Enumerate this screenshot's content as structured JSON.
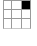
{
  "widget": {
    "type": "grid-selector",
    "name": "3x3 grid",
    "rows": 3,
    "columns": 3,
    "line_color": "#9a9a9a",
    "bottom_line_color": "#c8c8c8",
    "fill_color": "#000000",
    "background_color": "#ffffff",
    "cells": [
      {
        "row": 0,
        "col": 0,
        "state": "empty",
        "label": ""
      },
      {
        "row": 0,
        "col": 1,
        "state": "empty",
        "label": ""
      },
      {
        "row": 0,
        "col": 2,
        "state": "filled",
        "label": ""
      },
      {
        "row": 1,
        "col": 0,
        "state": "empty",
        "label": ""
      },
      {
        "row": 1,
        "col": 1,
        "state": "empty",
        "label": ""
      },
      {
        "row": 1,
        "col": 2,
        "state": "empty",
        "label": ""
      },
      {
        "row": 2,
        "col": 0,
        "state": "empty",
        "label": ""
      },
      {
        "row": 2,
        "col": 1,
        "state": "empty",
        "label": ""
      },
      {
        "row": 2,
        "col": 2,
        "state": "empty",
        "label": ""
      }
    ],
    "selected_cell": {
      "row": 0,
      "col": 2
    }
  },
  "canvas": {
    "width": 37,
    "height": 46,
    "background_color": "#ffffff"
  }
}
